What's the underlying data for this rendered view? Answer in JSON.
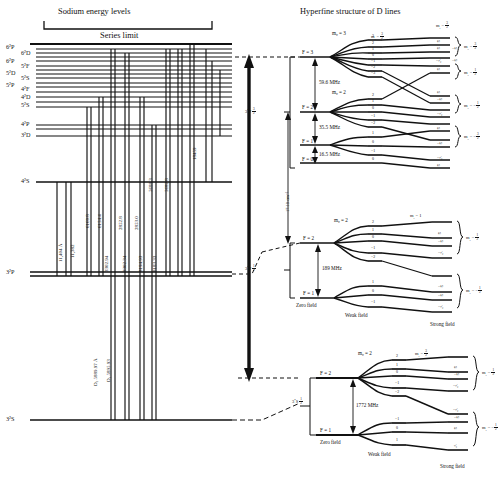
{
  "figure": {
    "left_panel_title": "Sodium energy levels",
    "right_panel_title": "Hyperfine structure of D lines",
    "series_limit": "Series limit"
  },
  "left_panel": {
    "term_labels": [
      {
        "text": "6²P",
        "x": 6,
        "y": 46
      },
      {
        "text": "6²D",
        "x": 22,
        "y": 52
      },
      {
        "text": "6²P",
        "x": 6,
        "y": 60
      },
      {
        "text": "5²F",
        "x": 22,
        "y": 65
      },
      {
        "text": "5²D",
        "x": 6,
        "y": 71
      },
      {
        "text": "5²S",
        "x": 22,
        "y": 77
      },
      {
        "text": "5²P",
        "x": 6,
        "y": 83
      },
      {
        "text": "4²F",
        "x": 22,
        "y": 88
      },
      {
        "text": "4²D",
        "x": 22,
        "y": 96
      },
      {
        "text": "5²S",
        "x": 22,
        "y": 104
      },
      {
        "text": "4²P",
        "x": 22,
        "y": 124
      },
      {
        "text": "3²D",
        "x": 22,
        "y": 134
      },
      {
        "text": "4²S",
        "x": 22,
        "y": 180
      },
      {
        "text": "3²P",
        "x": 6,
        "y": 272
      },
      {
        "text": "3²S",
        "x": 6,
        "y": 418
      }
    ],
    "wavelengths": [
      {
        "text": "11,404 Å",
        "x": 58,
        "y": 262
      },
      {
        "text": "11,382",
        "x": 70,
        "y": 262
      },
      {
        "text": "6160.8",
        "x": 80,
        "y": 222
      },
      {
        "text": "6154.4",
        "x": 92,
        "y": 222
      },
      {
        "text": "3302.94",
        "x": 104,
        "y": 270
      },
      {
        "text": "2852.8",
        "x": 116,
        "y": 222
      },
      {
        "text": "3302.34",
        "x": 120,
        "y": 270
      },
      {
        "text": "2853.0",
        "x": 133,
        "y": 222
      },
      {
        "text": "8194.93",
        "x": 138,
        "y": 270
      },
      {
        "text": "5688.3",
        "x": 146,
        "y": 190
      },
      {
        "text": "8183.33",
        "x": 152,
        "y": 270
      },
      {
        "text": "5682.8",
        "x": 160,
        "y": 190
      },
      {
        "text": "18459",
        "x": 191,
        "y": 160
      }
    ],
    "d_lines": [
      {
        "text": "D₂ 5889.97 Å",
        "x": 92,
        "y": 383
      },
      {
        "text": "D₁ 5895.93",
        "x": 104,
        "y": 378
      }
    ]
  },
  "right_panel": {
    "transition_gap_label": "17.19 cm⁻¹",
    "groups": [
      {
        "name": "3p-three-halves",
        "state": "3²P",
        "state_j": "3/2",
        "splittings": [
          {
            "label": "59.6 MHz"
          },
          {
            "label": "35.5 MHz"
          },
          {
            "label": "16.5 MHz"
          }
        ],
        "f_levels": [
          {
            "label": "F = 3",
            "mf_header": "mᵩ = 3",
            "mf": [
              "3",
              "2",
              "1",
              "0",
              "−1",
              "−2",
              "−3"
            ]
          },
          {
            "label": "F = 2",
            "mf_header": "mᵩ = 2",
            "mf": [
              "2",
              "1",
              "0",
              "−1",
              "−2"
            ]
          },
          {
            "label": "F = 1",
            "mf_header": "",
            "mf": [
              "1",
              "0",
              "−1"
            ]
          },
          {
            "label": "F = 0",
            "mf_header": "",
            "mf": [
              "0"
            ]
          }
        ],
        "mi_header": "m₁ = 3/2",
        "mj_brackets": [
          "mⱼ = 3/2",
          "mⱼ = 1/2",
          "mⱼ = −1/2",
          "mⱼ = −3/2"
        ]
      },
      {
        "name": "3p-one-half",
        "state": "3²P",
        "state_j": "1/2",
        "splittings": [
          {
            "label": "189 MHz"
          }
        ],
        "f_levels": [
          {
            "label": "F = 2",
            "mf_header": "mᵩ = 2",
            "mf": [
              "2",
              "1",
              "0",
              "−1",
              "−2"
            ]
          },
          {
            "label": "F = 1",
            "mf_header": "",
            "mf": [
              "1",
              "0",
              "−1"
            ]
          }
        ],
        "mi_header": "m₁ = 1",
        "mj_brackets": [
          "mⱼ = 1/2",
          "mⱼ = −1/2"
        ],
        "field_labels": [
          "Zero field",
          "Weak field",
          "Strong field"
        ]
      },
      {
        "name": "3s-one-half",
        "state": "3²S",
        "state_j": "1/2",
        "splittings": [
          {
            "label": "1772 MHz"
          }
        ],
        "f_levels": [
          {
            "label": "F = 2",
            "mf_header": "mᵩ = 2",
            "mf": [
              "2",
              "1",
              "0",
              "−1",
              "−2"
            ]
          },
          {
            "label": "F = 1",
            "mf_header": "",
            "mf": [
              "−1",
              "0",
              "1"
            ]
          }
        ],
        "mi_header": "m₁ = 3/2",
        "mj_brackets": [
          "mⱼ = 1/2",
          "mⱼ = −1/2"
        ],
        "field_labels": [
          "Zero field",
          "Weak field",
          "Strong field"
        ]
      }
    ],
    "mi_fraction_columns": {
      "top_group": [
        "3/2",
        "1/2",
        "−1/2",
        "−3/2"
      ],
      "values": [
        "3/2",
        "1/2",
        "−1/2",
        "−3/2"
      ]
    }
  }
}
